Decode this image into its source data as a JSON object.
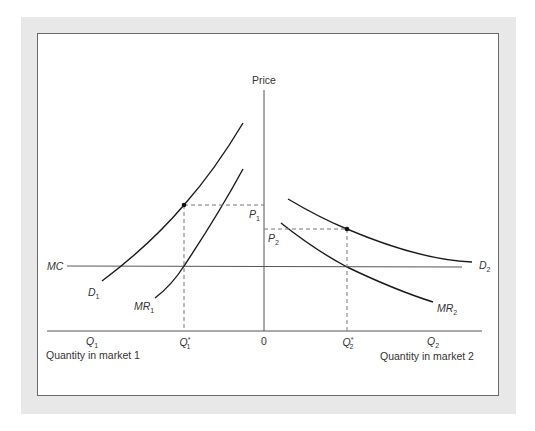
{
  "diagram": {
    "y_axis_label": "Price",
    "origin_label": "0",
    "mc_label": "MC",
    "market1": {
      "quantity_axis_label": "Quantity in market 1",
      "q_label": "Q",
      "q_sub": "1",
      "q_star_label": "Q",
      "q_star_sup": "*",
      "q_star_sub": "1",
      "demand_label": "D",
      "demand_sub": "1",
      "mr_label": "MR",
      "mr_sub": "1",
      "price_label": "P",
      "price_sub": "1"
    },
    "market2": {
      "quantity_axis_label": "Quantity in market 2",
      "q_label": "Q",
      "q_sub": "2",
      "q_star_label": "Q",
      "q_star_sup": "*",
      "q_star_sub": "2",
      "demand_label": "D",
      "demand_sub": "2",
      "mr_label": "MR",
      "mr_sub": "2",
      "price_label": "P",
      "price_sub": "2"
    },
    "colors": {
      "frame": "#e8e8e8",
      "curve": "#1a1a1a",
      "axis": "#555555",
      "dashed": "#777777"
    }
  }
}
